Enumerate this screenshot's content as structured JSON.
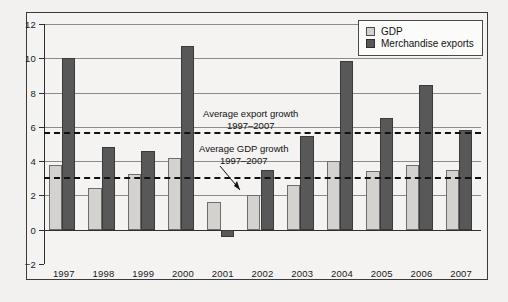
{
  "chart_data": {
    "type": "bar",
    "title": "",
    "subtitle": "",
    "xlabel": "",
    "ylabel": "",
    "ylim": [
      -2,
      12
    ],
    "ystep": 2,
    "grid": true,
    "legend_position": "top-right",
    "categories": [
      "1997",
      "1998",
      "1999",
      "2000",
      "2001",
      "2002",
      "2003",
      "2004",
      "2005",
      "2006",
      "2007"
    ],
    "yticks": [
      "12",
      "10",
      "8",
      "6",
      "4",
      "2",
      "0",
      "−2"
    ],
    "ytick_values": [
      12,
      10,
      8,
      6,
      4,
      2,
      0,
      -2
    ],
    "series": [
      {
        "name": "GDP",
        "color": "#d3d2cf",
        "values": [
          3.8,
          2.45,
          3.25,
          4.2,
          1.6,
          2.0,
          2.6,
          4.0,
          3.4,
          3.8,
          3.5
        ]
      },
      {
        "name": "Merchandise exports",
        "color": "#585858",
        "values": [
          10.0,
          4.8,
          4.6,
          10.7,
          -0.4,
          3.5,
          5.45,
          9.85,
          6.5,
          8.45,
          5.8
        ]
      }
    ],
    "reference_lines": [
      {
        "id": "avg-export",
        "label_line1": "Average export growth",
        "label_line2": "1997–2007",
        "value": 5.7,
        "style": "dashed"
      },
      {
        "id": "avg-gdp",
        "label_line1": "Average GDP growth",
        "label_line2": "1997–2007",
        "value": 3.05,
        "style": "dashed"
      }
    ],
    "annotations": [
      {
        "text": "Average export growth 1997–2007"
      },
      {
        "text": "Average GDP growth 1997–2007"
      }
    ]
  },
  "legend": {
    "items": [
      {
        "label": "GDP",
        "swatch": "gdp"
      },
      {
        "label": "Merchandise exports",
        "swatch": "exp"
      }
    ]
  }
}
